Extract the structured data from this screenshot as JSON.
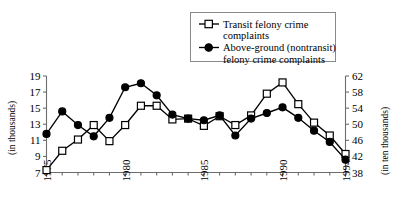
{
  "chart_data": {
    "type": "line",
    "title": "",
    "xlabel": "",
    "ylabel": "(in thousands)",
    "y2label": "(in ten thousands)",
    "grid": false,
    "legend_position": "top-center",
    "x": [
      1975,
      1976,
      1977,
      1978,
      1979,
      1980,
      1981,
      1982,
      1983,
      1984,
      1985,
      1986,
      1987,
      1988,
      1989,
      1990,
      1991,
      1992,
      1993,
      1994
    ],
    "xticks": [
      1975,
      1980,
      1985,
      1990,
      1994
    ],
    "xtick_labels": [
      "1975",
      "1980",
      "1985",
      "1990",
      "1994"
    ],
    "xlim": [
      1975,
      1994
    ],
    "ylim": [
      7,
      19
    ],
    "yticks": [
      7,
      9,
      11,
      13,
      15,
      17,
      19
    ],
    "ytick_labels": [
      "7",
      "9",
      "11",
      "13",
      "15",
      "17",
      "19"
    ],
    "y2lim": [
      38,
      62
    ],
    "y2ticks": [
      38,
      42,
      46,
      50,
      54,
      58,
      62
    ],
    "y2tick_labels": [
      "38",
      "42",
      "46",
      "50",
      "54",
      "58",
      "62"
    ],
    "series": [
      {
        "name": "Transit felony crime complaints",
        "marker": "open-square",
        "axis": "left",
        "values": [
          7.3,
          9.7,
          11.1,
          12.9,
          10.9,
          12.9,
          15.3,
          15.3,
          13.6,
          13.7,
          12.8,
          14.0,
          12.9,
          14.1,
          16.8,
          18.2,
          15.5,
          13.2,
          11.6,
          9.3
        ]
      },
      {
        "name": "Above-ground (nontransit) felony crime complaints",
        "marker": "filled-circle",
        "axis": "left",
        "values": [
          11.8,
          14.6,
          12.9,
          11.5,
          13.8,
          17.6,
          18.1,
          16.6,
          14.2,
          13.7,
          13.5,
          14.1,
          11.6,
          13.7,
          14.4,
          15.1,
          13.8,
          12.2,
          10.8,
          8.6
        ]
      }
    ]
  },
  "legend": {
    "entries": [
      {
        "label_line1": "Transit felony crime",
        "label_line2": "complaints",
        "marker": "open-square"
      },
      {
        "label_line1": "Above-ground (nontransit)",
        "label_line2": "felony crime complaints",
        "marker": "filled-circle"
      }
    ]
  },
  "colors": {
    "series_stroke": "#000000",
    "axis": "#6d6d6d",
    "background": "#ffffff",
    "legend_border": "#8a8a8a"
  }
}
